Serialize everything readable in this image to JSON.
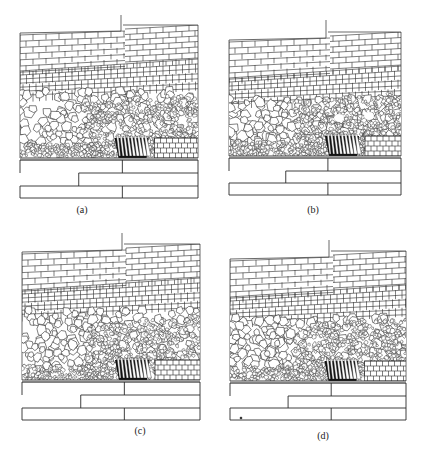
{
  "figure": {
    "panels": [
      {
        "id": "a",
        "label": "(a)",
        "variant": 0
      },
      {
        "id": "b",
        "label": "(b)",
        "variant": 1
      },
      {
        "id": "c",
        "label": "(c)",
        "variant": 2
      },
      {
        "id": "d",
        "label": "(d)",
        "variant": 3
      }
    ]
  },
  "colors": {
    "line": "#2a2a2a",
    "dense": "#111111",
    "background": "#ffffff"
  }
}
